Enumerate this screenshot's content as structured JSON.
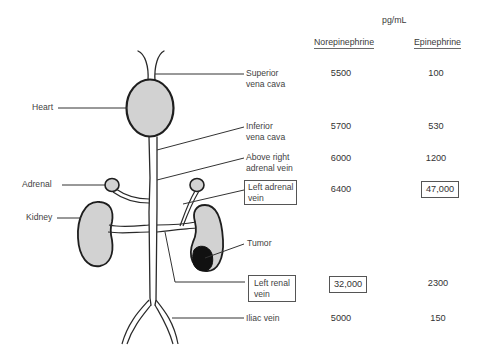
{
  "header": {
    "unit": "pg/mL",
    "columns": [
      "Norepinephrine",
      "Epinephrine"
    ]
  },
  "anatomy_labels": {
    "heart": "Heart",
    "adrenal": "Adrenal",
    "kidney": "Kidney",
    "tumor": "Tumor"
  },
  "sites": [
    {
      "line1": "Superior",
      "line2": "vena cava",
      "norepinephrine": "5500",
      "epinephrine": "100",
      "boxed_site": false,
      "boxed_value": null
    },
    {
      "line1": "Inferior",
      "line2": "vena cava",
      "norepinephrine": "5700",
      "epinephrine": "530",
      "boxed_site": false,
      "boxed_value": null
    },
    {
      "line1": "Above right",
      "line2": "adrenal vein",
      "norepinephrine": "6000",
      "epinephrine": "1200",
      "boxed_site": false,
      "boxed_value": null
    },
    {
      "line1": "Left adrenal",
      "line2": "vein",
      "norepinephrine": "6400",
      "epinephrine": "47,000",
      "boxed_site": true,
      "boxed_value": "epinephrine"
    },
    {
      "line1": "Left renal",
      "line2": "vein",
      "norepinephrine": "32,000",
      "epinephrine": "2300",
      "boxed_site": true,
      "boxed_value": "norepinephrine"
    },
    {
      "line1": "Iliac vein",
      "line2": "",
      "norepinephrine": "5000",
      "epinephrine": "150",
      "boxed_site": false,
      "boxed_value": null
    }
  ],
  "colors": {
    "organ_fill": "#d2d2d2",
    "tumor_fill": "#111111",
    "line": "#2a2a2a"
  }
}
